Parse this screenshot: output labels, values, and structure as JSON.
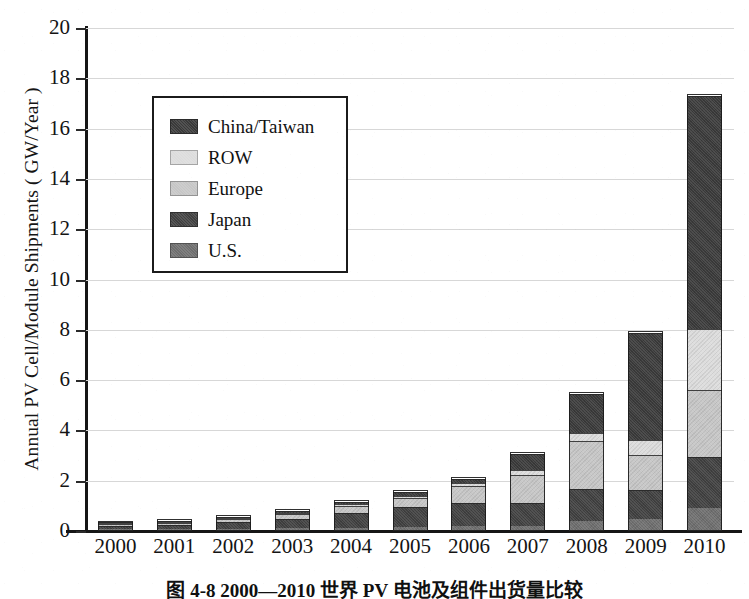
{
  "chart_data": {
    "type": "bar",
    "subtype": "stacked-bar",
    "title": "",
    "xlabel": "",
    "ylabel": "Annual PV Cell/Module Shipments ( GW/Year )",
    "ylim": [
      0,
      20
    ],
    "ytick_step": 2,
    "yticks": [
      0,
      2,
      4,
      6,
      8,
      10,
      12,
      14,
      16,
      18,
      20
    ],
    "ytick_labels": [
      "0",
      "2",
      "4",
      "6",
      "8",
      "10",
      "12",
      "14",
      "16",
      "18",
      "20"
    ],
    "grid": true,
    "grid_axis": "y",
    "legend_position": "upper-left-inside",
    "categories": [
      "2000",
      "2001",
      "2002",
      "2003",
      "2004",
      "2005",
      "2006",
      "2007",
      "2008",
      "2009",
      "2010"
    ],
    "stack_order_bottom_to_top": [
      "U.S.",
      "Japan",
      "Europe",
      "ROW",
      "China/Taiwan"
    ],
    "series": [
      {
        "name": "U.S.",
        "color": "#6e6e6e",
        "values": [
          0.07,
          0.08,
          0.1,
          0.11,
          0.13,
          0.15,
          0.18,
          0.2,
          0.41,
          0.48,
          0.9
        ]
      },
      {
        "name": "Japan",
        "color": "#404040",
        "values": [
          0.13,
          0.17,
          0.24,
          0.36,
          0.6,
          0.82,
          0.93,
          0.92,
          1.25,
          1.15,
          2.05
        ]
      },
      {
        "name": "Europe",
        "color": "#c6c6c6",
        "values": [
          0.06,
          0.07,
          0.13,
          0.2,
          0.26,
          0.35,
          0.68,
          1.1,
          1.9,
          1.4,
          2.65
        ]
      },
      {
        "name": "ROW",
        "color": "#dcdcdc",
        "values": [
          0.02,
          0.03,
          0.04,
          0.06,
          0.07,
          0.08,
          0.11,
          0.2,
          0.35,
          0.6,
          2.45
        ]
      },
      {
        "name": "China/Taiwan",
        "color": "#3a3a3a",
        "values": [
          0.02,
          0.03,
          0.04,
          0.07,
          0.1,
          0.15,
          0.15,
          0.65,
          1.55,
          4.25,
          9.25
        ]
      }
    ],
    "totals": [
      0.3,
      0.38,
      0.55,
      0.8,
      1.16,
      1.55,
      2.05,
      3.07,
      5.46,
      7.88,
      17.3
    ]
  },
  "legend": {
    "items": [
      {
        "label": "China/Taiwan",
        "color": "#3a3a3a"
      },
      {
        "label": "ROW",
        "color": "#dcdcdc"
      },
      {
        "label": "Europe",
        "color": "#c6c6c6"
      },
      {
        "label": "Japan",
        "color": "#404040"
      },
      {
        "label": "U.S.",
        "color": "#6e6e6e"
      }
    ]
  },
  "caption": {
    "text": "图 4-8  2000—2010 世界 PV 电池及组件出货量比较"
  }
}
